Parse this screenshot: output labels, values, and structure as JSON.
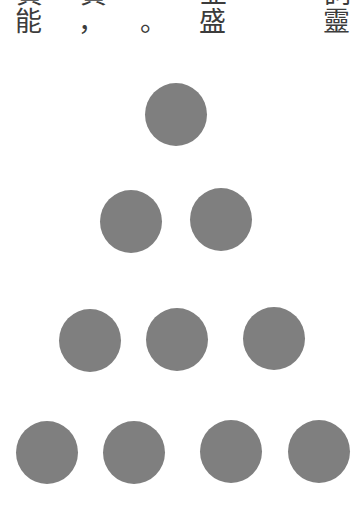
{
  "text": {
    "top_row_cut": [
      {
        "char": "負",
        "x": 16
      },
      {
        "char": "負",
        "x": 80
      },
      {
        "char": "並",
        "x": 200
      },
      {
        "char": "詞",
        "x": 324
      }
    ],
    "main_row": [
      {
        "char": "能",
        "x": 15
      },
      {
        "char": "，",
        "x": 78
      },
      {
        "char": "。",
        "x": 140
      },
      {
        "char": "盛",
        "x": 199
      },
      {
        "char": "靈",
        "x": 323
      }
    ]
  },
  "figure": {
    "dot_color": "#7f7f7f",
    "rows": [
      {
        "count": 1,
        "y": 83,
        "xs": [
          145
        ]
      },
      {
        "count": 2,
        "y": 189,
        "xs": [
          100,
          190
        ]
      },
      {
        "count": 3,
        "y": 308,
        "xs": [
          59,
          146,
          243
        ]
      },
      {
        "count": 4,
        "y": 421,
        "xs": [
          16,
          103,
          200,
          288
        ]
      }
    ]
  }
}
